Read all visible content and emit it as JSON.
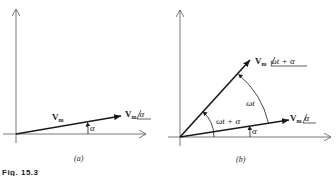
{
  "figure": {
    "caption_fragment": "Fig. 15.3",
    "panels": [
      {
        "id": "a",
        "label": "(a)",
        "vector_label": "V",
        "vector_subscript": "m",
        "tip_label_main": "V",
        "tip_label_sub": "m",
        "tip_label_angle": "α",
        "angle_label": "α"
      },
      {
        "id": "b",
        "label": "(b)",
        "rotated_tip_main": "V",
        "rotated_tip_sub": "m",
        "rotated_tip_angle": "ωt + α",
        "ref_tip_main": "V",
        "ref_tip_sub": "m",
        "ref_tip_angle": "α",
        "arc_omega_t": "ωt",
        "arc_omega_t_alpha": "ωt + α",
        "arc_alpha": "α"
      }
    ],
    "colors": {
      "ink": "#1a1a1a",
      "axis": "#555555",
      "background": "#ffffff"
    }
  }
}
